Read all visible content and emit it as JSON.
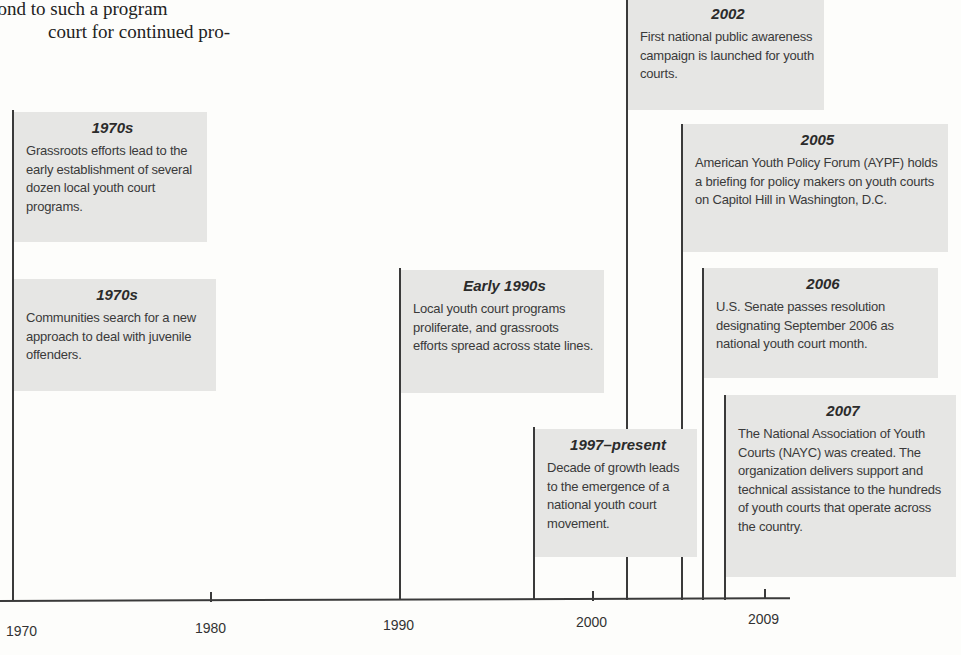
{
  "prose": {
    "lines": [
      "pond to such a program",
      "court for continued pro-"
    ]
  },
  "timeline": {
    "axis": {
      "tick_labels": [
        "1970",
        "1980",
        "1990",
        "2000",
        "2009"
      ]
    },
    "events": [
      {
        "id": "1970s-grassroots",
        "title": "1970s",
        "text": "Grassroots efforts lead to the early establishment of several dozen local youth court programs."
      },
      {
        "id": "1970s-communities",
        "title": "1970s",
        "text": "Communities search for a new approach to deal with juvenile offenders."
      },
      {
        "id": "early-1990s",
        "title": "Early 1990s",
        "text": "Local youth court programs proliferate, and grassroots efforts spread across state lines."
      },
      {
        "id": "1997-present",
        "title": "1997–present",
        "text": "Decade of growth leads to the emergence of a national youth court movement."
      },
      {
        "id": "2002",
        "title": "2002",
        "text": "First national public awareness campaign is launched for youth courts."
      },
      {
        "id": "2005",
        "title": "2005",
        "text": "American Youth Policy Forum (AYPF) holds a briefing for policy makers on youth courts on Capitol Hill in Washington, D.C."
      },
      {
        "id": "2006",
        "title": "2006",
        "text": "U.S. Senate passes resolution designating September 2006 as national youth court month."
      },
      {
        "id": "2007",
        "title": "2007",
        "text": "The National Association of Youth Courts (NAYC) was created. The organization delivers support and technical assistance to the hundreds of youth courts that operate across the country."
      }
    ]
  },
  "colors": {
    "box_fill": "#e6e6e4",
    "line": "#3a3a3a",
    "background": "#fdfdfb"
  }
}
